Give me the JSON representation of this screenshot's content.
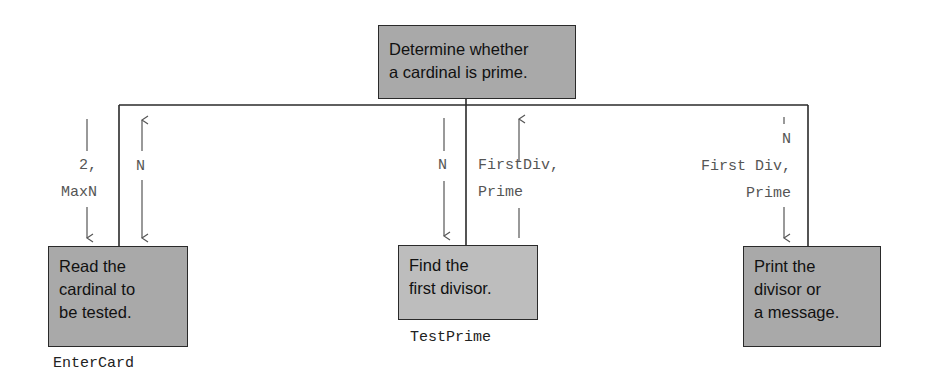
{
  "diagram": {
    "type": "structure-chart",
    "root": {
      "label": "Determine whether\na cardinal is prime."
    },
    "modules": [
      {
        "label": "Read the\ncardinal to\nbe tested.",
        "name": "EnterCard",
        "flows_in": "2,\nMaxN",
        "flows_out": "N"
      },
      {
        "label": "Find the\nfirst divisor.",
        "name": "TestPrime",
        "flows_in": "N",
        "flows_out": "FirstDiv,\nPrime"
      },
      {
        "label": "Print the\ndivisor or\na message.",
        "name": "",
        "flows_in": "N\nFirst Div,\nPrime",
        "flows_out": ""
      }
    ]
  },
  "colors": {
    "box_fill": "#a9a9a9",
    "box_fill_light": "#bdbdbd",
    "line": "#2a2a2a",
    "flow_text": "#555555"
  }
}
